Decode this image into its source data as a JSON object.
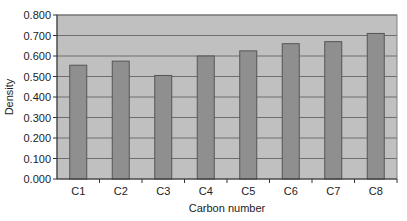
{
  "chart_data": {
    "type": "bar",
    "title": "",
    "xlabel": "Carbon number",
    "ylabel": "Density",
    "categories": [
      "C1",
      "C2",
      "C3",
      "C4",
      "C5",
      "C6",
      "C7",
      "C8"
    ],
    "values": [
      0.555,
      0.575,
      0.505,
      0.6,
      0.625,
      0.66,
      0.67,
      0.71
    ],
    "ylim": [
      0,
      0.8
    ],
    "yticks": [
      "0.000",
      "0.100",
      "0.200",
      "0.300",
      "0.400",
      "0.500",
      "0.600",
      "0.700",
      "0.800"
    ],
    "grid": true,
    "legend": "none",
    "colors": {
      "plot_bg": "#c0c0c0",
      "bar": "#8f8f8f",
      "bar_border": "#555555",
      "grid": "#6e6e6e"
    }
  }
}
